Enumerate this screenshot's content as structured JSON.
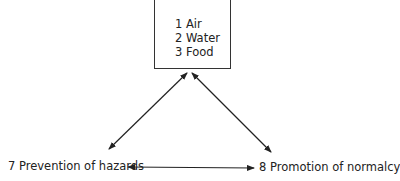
{
  "diagram": {
    "top_box": {
      "items": [
        "1 Air",
        "2 Water",
        "3 Food"
      ]
    },
    "left_node": {
      "label": "7 Prevention of hazards"
    },
    "right_node": {
      "label": "8 Promotion of normalcy"
    },
    "edges": [
      {
        "from": "top_box",
        "to": "left_node",
        "type": "bidirectional"
      },
      {
        "from": "top_box",
        "to": "right_node",
        "type": "bidirectional"
      },
      {
        "from": "left_node",
        "to": "right_node",
        "type": "bidirectional"
      }
    ]
  }
}
